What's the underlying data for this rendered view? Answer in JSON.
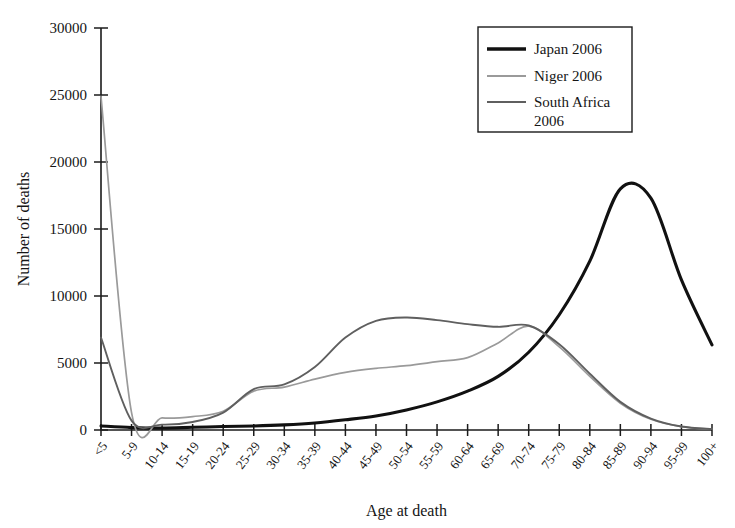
{
  "chart_data": {
    "type": "line",
    "title": "",
    "xlabel": "Age at death",
    "ylabel": "Number of deaths",
    "ylim": [
      0,
      30000
    ],
    "ytick_values": [
      0,
      5000,
      10000,
      15000,
      20000,
      25000,
      30000
    ],
    "ytick_labels": [
      "0",
      "5000",
      "10000",
      "15000",
      "20000",
      "25000",
      "30000"
    ],
    "grid": false,
    "legend_position": "top-right",
    "categories": [
      "<5",
      "5-9",
      "10-14",
      "15-19",
      "20-24",
      "25-29",
      "30-34",
      "35-39",
      "40-44",
      "45-49",
      "50-54",
      "55-59",
      "60-64",
      "65-69",
      "70-74",
      "75-79",
      "80-84",
      "85-89",
      "90-94",
      "95-99",
      "100+"
    ],
    "series": [
      {
        "name": "Japan 2006",
        "color": "#111111",
        "width": 3.1,
        "values": [
          300,
          180,
          140,
          200,
          260,
          300,
          380,
          520,
          760,
          1050,
          1500,
          2100,
          2900,
          4000,
          5800,
          8600,
          12600,
          18000,
          17300,
          11200,
          6350
        ]
      },
      {
        "name": "Niger 2006",
        "color": "#9a9a9a",
        "width": 1.7,
        "values": [
          24900,
          1300,
          900,
          1000,
          1400,
          2900,
          3200,
          3800,
          4300,
          4600,
          4800,
          5100,
          5400,
          6500,
          7750,
          6200,
          4000,
          2000,
          800,
          250,
          60
        ]
      },
      {
        "name": "South Africa 2006",
        "color": "#5f5f5f",
        "width": 1.9,
        "values": [
          6900,
          700,
          400,
          600,
          1300,
          3050,
          3400,
          4700,
          6900,
          8150,
          8400,
          8200,
          7900,
          7700,
          7800,
          6400,
          4200,
          2100,
          850,
          260,
          70
        ]
      }
    ]
  },
  "legend": {
    "entries": [
      {
        "label": "Japan 2006"
      },
      {
        "label": "Niger 2006"
      },
      {
        "label": "South Africa"
      },
      {
        "label": "2006"
      }
    ]
  },
  "axes": {
    "x_title": "Age at death",
    "y_title": "Number of deaths"
  }
}
